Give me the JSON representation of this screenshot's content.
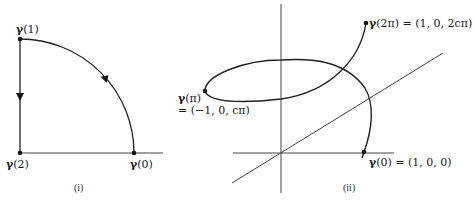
{
  "panel_i": {
    "caption": "(i)",
    "points": {
      "gamma0": {
        "sym": "γ",
        "arg": "(0)"
      },
      "gamma1": {
        "sym": "γ",
        "arg": "(1)"
      },
      "gamma2": {
        "sym": "γ",
        "arg": "(2)"
      }
    },
    "description": "Closed path: quarter circle arc from γ(0) to γ(1), vertical segment γ(1) to γ(2), horizontal segment γ(2) to γ(0)"
  },
  "panel_ii": {
    "caption": "(ii)",
    "points": {
      "gamma0": {
        "sym": "γ",
        "arg": "(0) = (1, 0, 0)"
      },
      "gammapi_a": {
        "sym": "γ",
        "arg": "(π)"
      },
      "gammapi_b": "= (−1, 0, cπ)",
      "gamma2pi": {
        "sym": "γ",
        "arg": "(2π) = (1, 0, 2cπ)"
      }
    },
    "description": "Helix in 3D axes from γ(0) through γ(π) to γ(2π)"
  },
  "colors": {
    "stroke": "#1a1a1a",
    "axis": "#444444",
    "background": "#ffffff"
  }
}
